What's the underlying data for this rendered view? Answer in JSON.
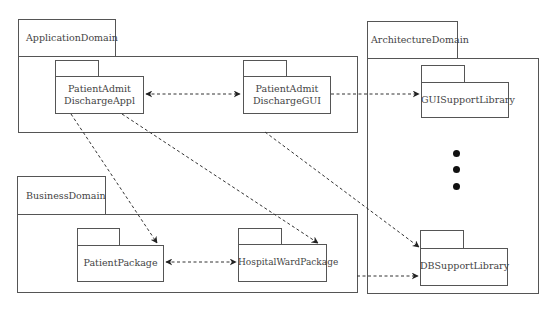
{
  "diagram": {
    "type": "UML package diagram",
    "domains": [
      {
        "id": "application",
        "label": "ApplicationDomain"
      },
      {
        "id": "business",
        "label": "BusinessDomain"
      },
      {
        "id": "architecture",
        "label": "ArchitectureDomain"
      }
    ],
    "packages": [
      {
        "id": "pada",
        "line1": "PatientAdmit",
        "line2": "DischargeAppl",
        "domain": "application"
      },
      {
        "id": "padg",
        "line1": "PatientAdmit",
        "line2": "DischargeGUI",
        "domain": "application"
      },
      {
        "id": "pp",
        "label": "PatientPackage",
        "domain": "business"
      },
      {
        "id": "hwp",
        "label": "HospitalWardPackage",
        "domain": "business"
      },
      {
        "id": "gui",
        "label": "GUISupportLibrary",
        "domain": "architecture"
      },
      {
        "id": "db",
        "label": "DBSupportLibrary",
        "domain": "architecture"
      }
    ],
    "dependencies": [
      {
        "from": "pada",
        "to": "padg",
        "bidirectional": true
      },
      {
        "from": "pp",
        "to": "hwp",
        "bidirectional": true
      },
      {
        "from": "padg",
        "to": "gui",
        "bidirectional": false
      },
      {
        "from": "pada",
        "to": "pp",
        "bidirectional": false
      },
      {
        "from": "pada",
        "to": "hwp",
        "bidirectional": false
      },
      {
        "from": "padg",
        "to": "db",
        "bidirectional": false
      },
      {
        "from": "hwp",
        "to": "db",
        "bidirectional": false
      }
    ],
    "ellipsis": "vertical dots (more libraries)"
  }
}
